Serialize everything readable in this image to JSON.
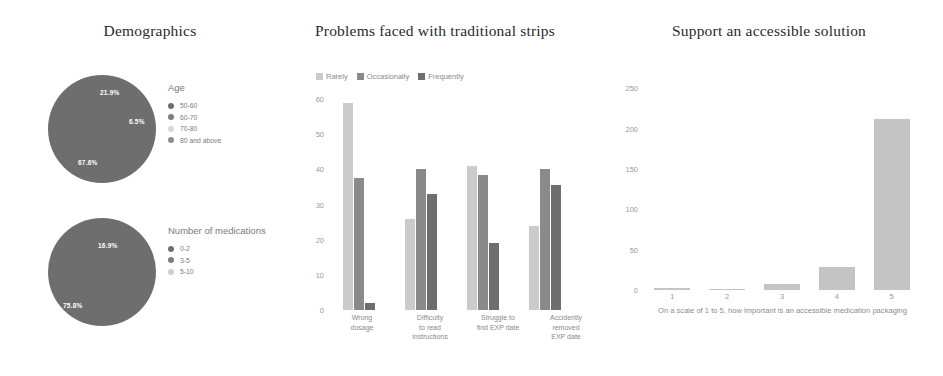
{
  "panels": {
    "demographics": {
      "title": "Demographics"
    },
    "problems": {
      "title": "Problems faced with traditional strips"
    },
    "support": {
      "title": "Support an accessible solution"
    }
  },
  "colors": {
    "dark_gray": "#6e6e6e",
    "mid_gray": "#8f8f8f",
    "light_gray": "#c9c9c9",
    "pale_gray": "#dcdcdc",
    "title_text": "#2b2b2b",
    "axis_text": "#9a9a9a"
  },
  "chart_data": [
    {
      "type": "pie",
      "title": "Age",
      "labels": [
        "50-60",
        "60-70",
        "70-80",
        "80 and above"
      ],
      "values": [
        67.6,
        21.9,
        6.5,
        4.0
      ],
      "value_labels": [
        "67.6%",
        "21.9%",
        "6.5%",
        ""
      ],
      "colors": [
        "#6e6e6e",
        "#7d7d7d",
        "#d7d7d7",
        "#8c8c8c"
      ],
      "legend_position": "right",
      "legend_title": "Age"
    },
    {
      "type": "pie",
      "title": "Number of medications",
      "labels": [
        "0-2",
        "3-5",
        "5-10"
      ],
      "values": [
        75.8,
        16.9,
        7.3
      ],
      "value_labels": [
        "75.8%",
        "16.9%",
        ""
      ],
      "colors": [
        "#6e6e6e",
        "#7d7d7d",
        "#cfcfcf"
      ],
      "legend_position": "right",
      "legend_title": "Number of medications"
    },
    {
      "type": "bar",
      "title": "Problems faced with traditional strips",
      "categories": [
        "Wrong dosage",
        "Difficulty to read instructions",
        "Struggle to find EXP date",
        "Accidently removed EXP date"
      ],
      "category_lines": [
        [
          "Wrong",
          "dosage"
        ],
        [
          "Difficulty",
          "to read",
          "instructions"
        ],
        [
          "Struggle to",
          "find EXP date"
        ],
        [
          "Accidently",
          "removed",
          "EXP date"
        ]
      ],
      "series": [
        {
          "name": "Rarely",
          "color": "#cbcbcb",
          "values": [
            59,
            26,
            41,
            24
          ]
        },
        {
          "name": "Occasionally",
          "color": "#8a8a8a",
          "values": [
            37.5,
            40,
            38.5,
            40
          ]
        },
        {
          "name": "Frequently",
          "color": "#6e6e6e",
          "values": [
            2,
            33,
            19,
            35.5
          ]
        }
      ],
      "ylim": [
        0,
        62
      ],
      "yticks": [
        0,
        10,
        20,
        30,
        40,
        50,
        60
      ],
      "xlabel": "",
      "ylabel": "",
      "grid": false,
      "legend_position": "top"
    },
    {
      "type": "bar",
      "title": "Support an accessible solution",
      "categories": [
        "1",
        "2",
        "3",
        "4",
        "5"
      ],
      "values": [
        3,
        1,
        7,
        28,
        212
      ],
      "ylim": [
        0,
        258
      ],
      "yticks": [
        0,
        50,
        100,
        150,
        200,
        250
      ],
      "bar_color": "#c4c4c4",
      "xlabel": "On a scale of 1 to 5, how important is an accessible medication packaging",
      "ylabel": "",
      "grid": false
    }
  ]
}
